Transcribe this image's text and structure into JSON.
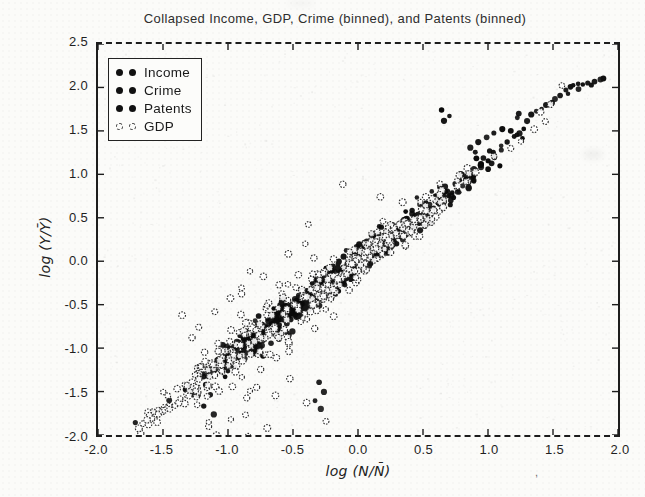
{
  "scan_artifacts": {
    "mark": ","
  },
  "chart_data": {
    "type": "scatter",
    "title": "Collapsed Income, GDP, Crime (binned), and Patents (binned)",
    "xlabel": "log (N/N̄)",
    "ylabel": "log (Y/Ȳ)",
    "xlim": [
      -2.0,
      2.0
    ],
    "ylim": [
      -2.0,
      2.5
    ],
    "xticks": [
      "-2.0",
      "-1.5",
      "-1.0",
      "-0.5",
      "0.0",
      "0.5",
      "1.0",
      "1.5",
      "2.0"
    ],
    "yticks": [
      "2.5",
      "2.0",
      "1.5",
      "1.0",
      "0.5",
      "0.0",
      "-0.5",
      "-1.0",
      "-1.5",
      "-2.0"
    ],
    "grid": false,
    "legend_position": "upper-left",
    "frame_color": "#1d1d1d",
    "trend": {
      "description": "all four datasets collapse onto a common scaling line",
      "slope": 1.12,
      "intercept": 0.0
    },
    "series": [
      {
        "name": "Income",
        "marker": "filled-circle",
        "color": "#0f0f0f",
        "radius": 2.7,
        "seed": 7,
        "generators": [
          {
            "count": 170,
            "x_min": -1.35,
            "x_max": 0.3,
            "slope": 1.12,
            "intercept": 0.0,
            "y_std": 0.07
          },
          {
            "count": 120,
            "x_min": -0.6,
            "x_max": 1.05,
            "slope": 1.12,
            "intercept": 0.0,
            "y_std": 0.07
          }
        ],
        "extra_points": [
          [
            1.56,
            1.9
          ],
          [
            1.6,
            1.97
          ],
          [
            1.63,
            2.0
          ],
          [
            1.66,
            2.02
          ],
          [
            1.69,
            2.04
          ],
          [
            1.73,
            2.03
          ],
          [
            1.77,
            2.05
          ],
          [
            1.82,
            2.06
          ],
          [
            1.86,
            2.09
          ],
          [
            1.89,
            2.11
          ],
          [
            1.62,
            1.93
          ],
          [
            1.7,
            1.98
          ],
          [
            1.8,
            2.03
          ],
          [
            1.33,
            1.69
          ],
          [
            1.37,
            1.73
          ],
          [
            1.41,
            1.76
          ],
          [
            1.45,
            1.79
          ],
          [
            1.49,
            1.83
          ],
          [
            1.52,
            1.86
          ],
          [
            1.1,
            1.33
          ],
          [
            1.15,
            1.38
          ],
          [
            1.2,
            1.43
          ],
          [
            1.24,
            1.47
          ],
          [
            1.28,
            1.52
          ]
        ]
      },
      {
        "name": "Crime",
        "marker": "filled-circle",
        "color": "#161616",
        "radius": 2.7,
        "seed": 13,
        "generators": [
          {
            "count": 150,
            "x_min": -1.3,
            "x_max": 0.25,
            "slope": 1.1,
            "intercept": -0.02,
            "y_std": 0.09
          },
          {
            "count": 100,
            "x_min": -0.55,
            "x_max": 1.0,
            "slope": 1.1,
            "intercept": -0.02,
            "y_std": 0.09
          }
        ],
        "extra_points": [
          [
            -1.17,
            -1.42
          ],
          [
            -1.14,
            -1.54
          ],
          [
            -1.19,
            -1.66
          ],
          [
            -1.11,
            -1.77
          ],
          [
            -1.22,
            -1.31
          ],
          [
            -0.3,
            -1.4
          ],
          [
            -0.26,
            -1.51
          ],
          [
            -0.33,
            -1.6
          ],
          [
            -0.29,
            -1.7
          ],
          [
            -1.71,
            -1.86
          ],
          [
            -1.58,
            -1.74
          ],
          [
            -1.45,
            -1.6
          ],
          [
            1.05,
            1.22
          ],
          [
            1.1,
            1.28
          ]
        ]
      },
      {
        "name": "Patents",
        "marker": "filled-circle",
        "color": "#0a0a0a",
        "radius": 2.7,
        "seed": 29,
        "generators": [
          {
            "count": 150,
            "x_min": -1.3,
            "x_max": 0.3,
            "slope": 1.14,
            "intercept": 0.02,
            "y_std": 0.08
          },
          {
            "count": 110,
            "x_min": -0.55,
            "x_max": 1.25,
            "slope": 1.14,
            "intercept": 0.02,
            "y_std": 0.08
          }
        ],
        "extra_points": [
          [
            0.64,
            1.74
          ],
          [
            0.66,
            1.61
          ],
          [
            0.7,
            1.67
          ],
          [
            0.93,
            1.37
          ],
          [
            0.99,
            1.42
          ],
          [
            1.05,
            1.47
          ],
          [
            1.11,
            1.52
          ],
          [
            1.17,
            1.5
          ],
          [
            1.22,
            1.45
          ],
          [
            1.27,
            1.41
          ],
          [
            1.24,
            1.7
          ],
          [
            1.3,
            1.62
          ],
          [
            0.86,
            1.3
          ],
          [
            0.9,
            1.25
          ]
        ]
      },
      {
        "name": "GDP",
        "marker": "open-circle",
        "color": "#2e2e2e",
        "radius": 3.0,
        "seed": 41,
        "generators": [
          {
            "count": 260,
            "x_min": -1.0,
            "x_max": 1.05,
            "slope": 1.1,
            "intercept": 0.0,
            "y_std": 0.12
          },
          {
            "count": 95,
            "x_min": -1.78,
            "x_max": -0.55,
            "slope": 1.1,
            "intercept": 0.0,
            "y_std": 0.12
          },
          {
            "count": 60,
            "x_min": -1.5,
            "x_max": 0.05,
            "slope": 1.1,
            "intercept": -0.05,
            "y_std": 0.38
          }
        ],
        "extra_points": [
          [
            -1.45,
            -1.7
          ],
          [
            -1.15,
            -1.86
          ],
          [
            -0.86,
            -1.76
          ],
          [
            -0.7,
            -1.92
          ],
          [
            -0.63,
            -1.55
          ],
          [
            -0.52,
            -1.35
          ],
          [
            -0.4,
            -1.62
          ],
          [
            -0.25,
            -1.85
          ],
          [
            -0.97,
            -1.44
          ],
          [
            -1.3,
            -1.55
          ],
          [
            -1.62,
            -1.82
          ],
          [
            -0.75,
            -1.25
          ],
          [
            -1.35,
            -0.62
          ],
          [
            -1.22,
            -0.76
          ],
          [
            -1.1,
            -0.58
          ],
          [
            -0.98,
            -0.42
          ],
          [
            -0.9,
            -0.3
          ],
          [
            -1.28,
            -0.88
          ],
          [
            0.17,
            0.74
          ],
          [
            -0.12,
            0.89
          ],
          [
            0.53,
            0.58
          ],
          [
            1.35,
            1.52
          ],
          [
            1.44,
            1.61
          ],
          [
            1.57,
            2.02
          ],
          [
            1.25,
            1.38
          ],
          [
            0.9,
            1.02
          ],
          [
            1.05,
            1.2
          ],
          [
            1.18,
            1.3
          ],
          [
            1.48,
            1.8
          ],
          [
            1.4,
            1.72
          ]
        ]
      }
    ]
  }
}
